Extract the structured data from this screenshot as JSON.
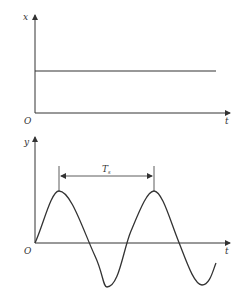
{
  "top_plot": {
    "y_axis_label": "x",
    "x_axis_label": "t",
    "origin_label": "O",
    "signal": "constant"
  },
  "bottom_plot": {
    "y_axis_label": "y",
    "x_axis_label": "t",
    "origin_label": "O",
    "signal": "sine",
    "period_label": "T",
    "period_subscript": "s"
  },
  "colors": {
    "stroke": "#333333",
    "background": "#ffffff"
  }
}
